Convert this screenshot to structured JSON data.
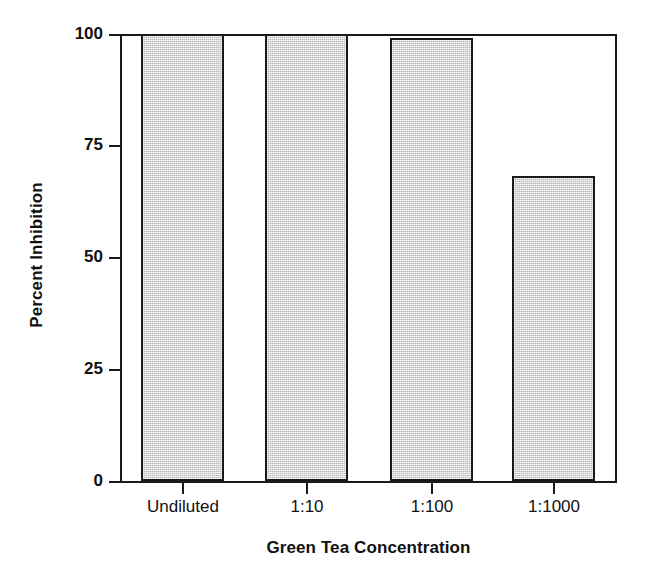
{
  "chart_data": {
    "type": "bar",
    "title": "",
    "xlabel": "Green Tea Concentration",
    "ylabel": "Percent Inhibition",
    "categories": [
      "Undiluted",
      "1:10",
      "1:100",
      "1:1000"
    ],
    "values": [
      100,
      100,
      99,
      68
    ],
    "ylim": [
      0,
      100
    ],
    "yticks": [
      0,
      25,
      50,
      75,
      100
    ],
    "ytick_labels": [
      "0",
      "25",
      "50",
      "75",
      "100"
    ],
    "grid": false,
    "legend": "none",
    "bar_fill_color": "#d9d9d9",
    "bar_edge_color": "#1a1a1a",
    "axis_color": "#1a1a1a",
    "background_color": "#ffffff"
  }
}
